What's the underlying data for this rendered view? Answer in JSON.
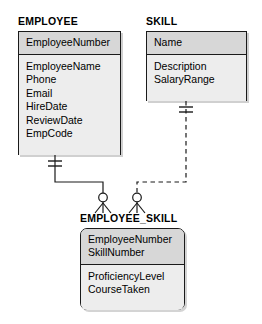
{
  "diagram": {
    "type": "entity-relationship-diagram",
    "notation": "crows-foot",
    "background_color": "#ffffff",
    "key_compartment_color": "#d7d7d7",
    "attribute_compartment_color": "#ededed",
    "border_color": "#1a1a1a",
    "entities": [
      {
        "id": "employee",
        "name": "EMPLOYEE",
        "shape": "rectangle",
        "key_attributes": [
          "EmployeeNumber"
        ],
        "attributes": [
          "EmployeeName",
          "Phone",
          "Email",
          "HireDate",
          "ReviewDate",
          "EmpCode"
        ]
      },
      {
        "id": "skill",
        "name": "SKILL",
        "shape": "rectangle",
        "key_attributes": [
          "Name"
        ],
        "attributes": [
          "Description",
          "SalaryRange"
        ]
      },
      {
        "id": "employee_skill",
        "name": "EMPLOYEE_SKILL",
        "shape": "rounded-rectangle",
        "key_attributes": [
          "EmployeeNumber",
          "SkillNumber"
        ],
        "attributes": [
          "ProficiencyLevel",
          "CourseTaken"
        ]
      }
    ],
    "relationships": [
      {
        "id": "employee-to-employee-skill",
        "from": "EMPLOYEE",
        "to": "EMPLOYEE_SKILL",
        "line_style": "solid",
        "identifying": true,
        "parent_cardinality": "one-mandatory",
        "child_cardinality": "zero-or-many"
      },
      {
        "id": "skill-to-employee-skill",
        "from": "SKILL",
        "to": "EMPLOYEE_SKILL",
        "line_style": "dashed",
        "identifying": false,
        "parent_cardinality": "one-mandatory",
        "child_cardinality": "zero-or-many"
      }
    ]
  }
}
